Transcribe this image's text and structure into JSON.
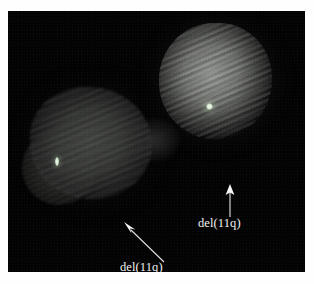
{
  "figure": {
    "type": "fish-micrograph",
    "background_color": "#030303",
    "page_color": "#ffffff",
    "panel": {
      "x": 8,
      "y": 11,
      "width": 297,
      "height": 261
    }
  },
  "nuclei": [
    {
      "id": "nucleus-right",
      "name": "upper-right-nucleus",
      "center": [
        207,
        70
      ],
      "radius": 57,
      "brightness": "bright",
      "color": "#8a8c88"
    },
    {
      "id": "nucleus-left",
      "name": "lower-left-nucleus",
      "center": [
        83,
        132
      ],
      "radius": 58,
      "brightness": "dim",
      "color": "#3c3e3b"
    }
  ],
  "signals": [
    {
      "id": "signal-right",
      "name": "fish-signal-upper-nucleus",
      "position": [
        201,
        95
      ],
      "color": "#f4fff0",
      "shape": "round"
    },
    {
      "id": "signal-left",
      "name": "fish-signal-left-nucleus",
      "position": [
        49,
        150
      ],
      "color": "#f0fbef",
      "shape": "elongated"
    }
  ],
  "annotations": [
    {
      "id": "annotation-right",
      "label": "del(11q)",
      "label_position": [
        190,
        205
      ],
      "arrow": {
        "from": [
          16,
          33
        ],
        "to": [
          16,
          1
        ],
        "direction": "up"
      },
      "color": "#f2f2f2"
    },
    {
      "id": "annotation-left",
      "label": "del(11q)",
      "label_position": [
        112,
        249
      ],
      "arrow": {
        "from": [
          43,
          42
        ],
        "to": [
          4,
          3
        ],
        "direction": "up-left"
      },
      "color": "#f2f2f2"
    }
  ]
}
